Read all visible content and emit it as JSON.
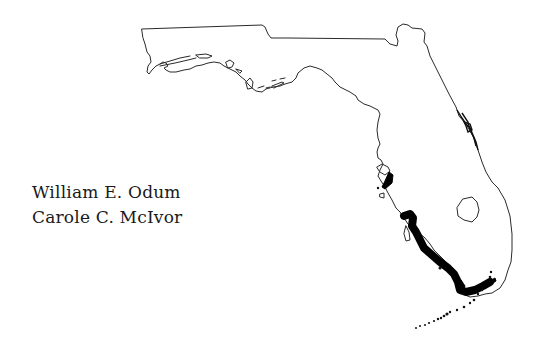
{
  "page": {
    "authors": [
      "William E. Odum",
      "Carole C. McIvor"
    ]
  },
  "map": {
    "region": "Florida",
    "features": [
      "state-outline",
      "lake-okeechobee",
      "mangrove-distribution-southwest-coast",
      "mangrove-tampa-bay",
      "indian-river-lagoon",
      "florida-keys"
    ],
    "colors": {
      "outline": "#2a2a2a",
      "mangrove": "#000000",
      "background": "#ffffff"
    }
  }
}
